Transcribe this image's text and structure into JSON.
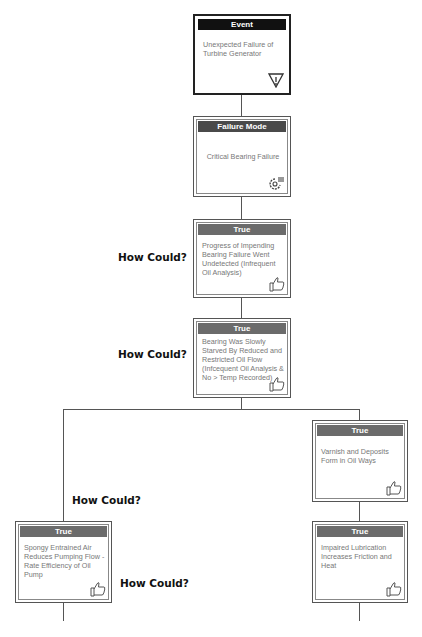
{
  "diagram": {
    "how_label": "How Could?",
    "event": {
      "header": "Event",
      "text": "Unexpected Failure of Turbine Generator",
      "icon": "warning-triangle-icon"
    },
    "failure_mode": {
      "header": "Failure Mode",
      "text": "Critical Bearing Failure",
      "icon": "gear-icon"
    },
    "hypotheses": [
      {
        "header": "True",
        "text": "Progress of Impending Bearing Failure Went Undetected (Infrequent Oil Analysis)",
        "icon": "thumbs-up-icon"
      },
      {
        "header": "True",
        "text": "Bearing Was Slowly Starved By Reduced and Restricted Oil Flow (Infcequent Oil Analysis & No > Temp Recorded)",
        "icon": "thumbs-up-icon"
      },
      {
        "header": "True",
        "text": "Varnish and Deposits Form in Oil Ways",
        "icon": "thumbs-up-icon"
      },
      {
        "header": "True",
        "text": "Spongy Entrained Air Reduces Pumping Flow -Rate Efficiency of Oil Pump",
        "icon": "thumbs-up-icon"
      },
      {
        "header": "True",
        "text": "Impaired Lubrication Increases Friction and Heat",
        "icon": "thumbs-up-icon"
      }
    ]
  }
}
